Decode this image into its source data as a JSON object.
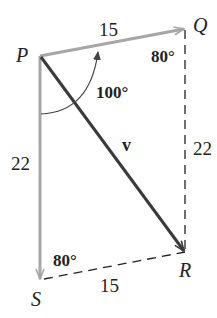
{
  "diagram": {
    "type": "vector parallelogram",
    "points": {
      "P": {
        "label": "P",
        "x": 40,
        "y": 56
      },
      "Q": {
        "label": "Q",
        "x": 185,
        "y": 28
      },
      "R": {
        "label": "R",
        "x": 185,
        "y": 252
      },
      "S": {
        "label": "S",
        "x": 40,
        "y": 280
      }
    },
    "vectors": [
      {
        "name": "PQ",
        "from": "P",
        "to": "Q",
        "magnitude_label": "15",
        "style": "solid",
        "color": "#a6a6a6"
      },
      {
        "name": "PS",
        "from": "P",
        "to": "S",
        "magnitude_label": "22",
        "style": "solid",
        "color": "#a6a6a6"
      },
      {
        "name": "v",
        "from": "P",
        "to": "R",
        "label": "v",
        "style": "solid",
        "color": "#3a3a3a"
      }
    ],
    "dashed_sides": [
      {
        "name": "QR",
        "from": "Q",
        "to": "R",
        "length_label": "22"
      },
      {
        "name": "SR",
        "from": "S",
        "to": "R",
        "length_label": "15"
      }
    ],
    "angles": {
      "P": "100°",
      "Q": "80°",
      "S": "80°"
    },
    "colors": {
      "gray_vector": "#a6a6a6",
      "resultant": "#3a3a3a",
      "dashed": "#222222",
      "text": "#222222"
    }
  }
}
